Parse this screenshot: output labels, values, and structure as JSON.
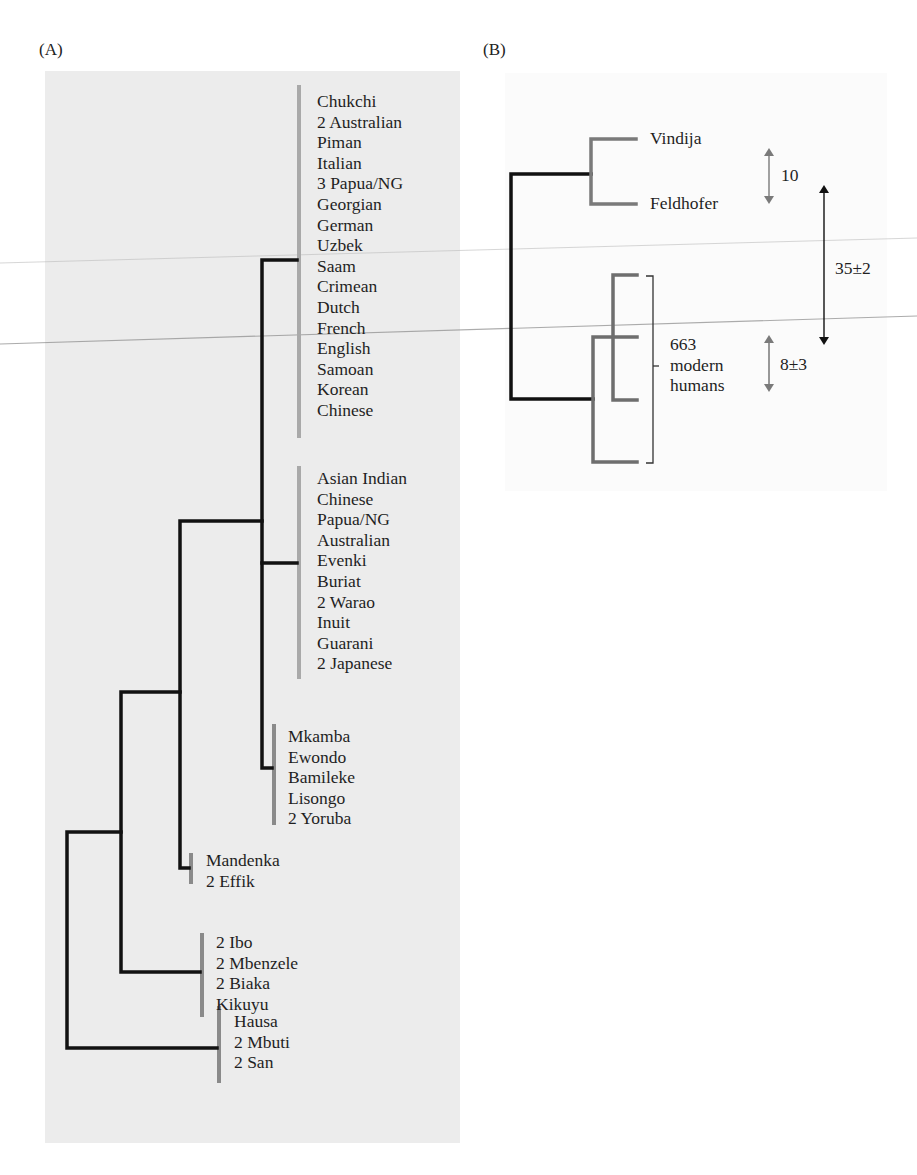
{
  "panels": {
    "a": {
      "label": "(A)",
      "groups": [
        {
          "taxa": [
            "Chukchi",
            "2 Australian",
            "Piman",
            "Italian",
            "3 Papua/NG",
            "Georgian",
            "German",
            "Uzbek",
            "Saam",
            "Crimean",
            "Dutch",
            "French",
            "English",
            "Samoan",
            "Korean",
            "Chinese"
          ]
        },
        {
          "taxa": [
            "Asian Indian",
            "Chinese",
            "Papua/NG",
            "Australian",
            "Evenki",
            "Buriat",
            "2 Warao",
            "Inuit",
            "Guarani",
            "2 Japanese"
          ]
        },
        {
          "taxa": [
            "Mkamba",
            "Ewondo",
            "Bamileke",
            "Lisongo",
            "2 Yoruba"
          ]
        },
        {
          "taxa": [
            "Mandenka",
            "2 Effik"
          ]
        },
        {
          "taxa": [
            "2 Ibo",
            "2 Mbenzele",
            "2 Biaka",
            "Kikuyu"
          ]
        },
        {
          "taxa": [
            "Hausa",
            "2 Mbuti",
            "2 San"
          ]
        }
      ]
    },
    "b": {
      "label": "(B)",
      "neanderthals": [
        "Vindija",
        "Feldhofer"
      ],
      "modern_label_line1": "663",
      "modern_label_line2": "modern",
      "modern_label_line3": "humans",
      "annotations": {
        "neanderthal_divergence": "10",
        "split_divergence": "35±2",
        "modern_divergence": "8±3"
      }
    }
  },
  "colors": {
    "branch_dark": "#111111",
    "branch_gray": "#7a7a7a",
    "bar_gray": "#a9a9a9",
    "panel_a_bg": "#ececec"
  }
}
